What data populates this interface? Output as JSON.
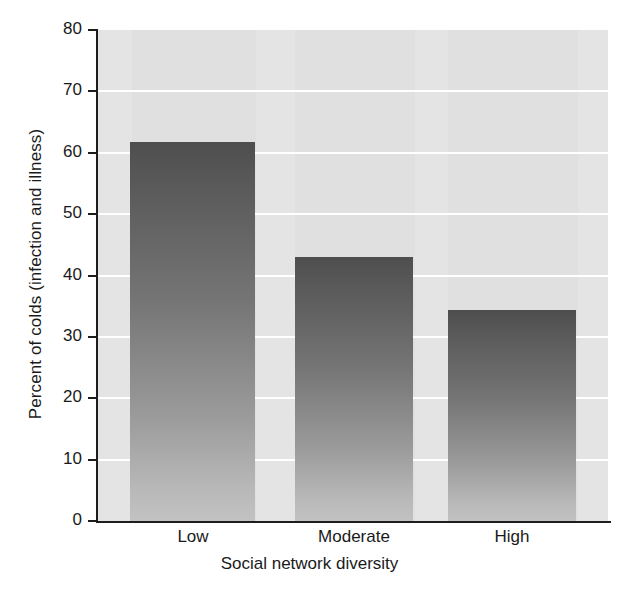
{
  "chart_data": {
    "type": "bar",
    "title": "",
    "subtitle": "",
    "categories": [
      "Low",
      "Moderate",
      "High"
    ],
    "values": [
      61.7,
      43.0,
      34.4
    ],
    "series": [
      {
        "name": "Percent of colds (infection and illness)",
        "values": [
          61.7,
          43.0,
          34.4
        ]
      }
    ],
    "xlabel": "Social network diversity",
    "ylabel": "Percent of colds (infection and illness)",
    "ylim": [
      0,
      80
    ],
    "yticks": [
      0,
      10,
      20,
      30,
      40,
      50,
      60,
      70,
      80
    ],
    "ytick_labels": [
      "0",
      "10",
      "20",
      "30",
      "40",
      "50",
      "60",
      "70",
      "80"
    ],
    "grid": "horizontal-white-on-gray",
    "legend": "none",
    "annotations": [],
    "colors": {
      "plot_background": "#e4e4e4",
      "gridline": "#ffffff",
      "axis": "#1d1d1d",
      "bar_top": "#4e4e4e",
      "bar_bottom": "#c2c2c2",
      "text": "#1a1a1a",
      "page_background": "#ffffff"
    }
  }
}
